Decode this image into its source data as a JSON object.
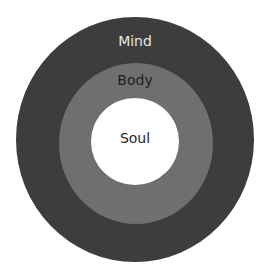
{
  "diagram": {
    "type": "concentric-circles",
    "rings": [
      {
        "label": "Mind",
        "color": "#3d3d3d",
        "text_color": "#e6e6e6"
      },
      {
        "label": "Body",
        "color": "#6f6f6f",
        "text_color": "#1e1e1e"
      },
      {
        "label": "Soul",
        "color": "#ffffff",
        "text_color": "#1e1e1e"
      }
    ]
  }
}
